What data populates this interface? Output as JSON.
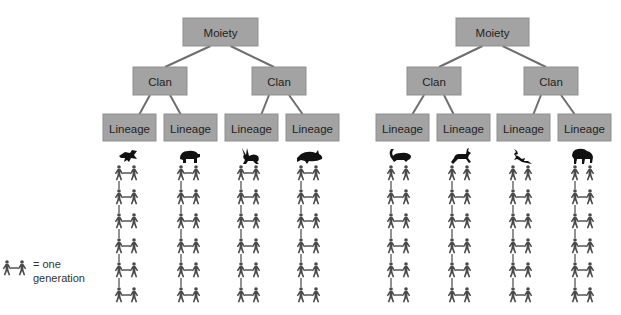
{
  "legend": {
    "line1": "= one",
    "line2": "generation"
  },
  "groups": [
    {
      "moiety": "Moiety",
      "clans": [
        {
          "label": "Clan",
          "lineages": [
            {
              "label": "Lineage",
              "totem": "bird",
              "generations": 6,
              "first_row_married": true
            },
            {
              "label": "Lineage",
              "totem": "bear",
              "generations": 6,
              "first_row_married": true
            }
          ]
        },
        {
          "label": "Clan",
          "lineages": [
            {
              "label": "Lineage",
              "totem": "rabbit",
              "generations": 6,
              "first_row_married": true
            },
            {
              "label": "Lineage",
              "totem": "fish",
              "generations": 6,
              "first_row_married": true
            }
          ]
        }
      ]
    },
    {
      "moiety": "Moiety",
      "clans": [
        {
          "label": "Clan",
          "lineages": [
            {
              "label": "Lineage",
              "totem": "skunk",
              "generations": 6,
              "first_row_married": false
            },
            {
              "label": "Lineage",
              "totem": "antelope",
              "generations": 6,
              "first_row_married": false
            }
          ]
        },
        {
          "label": "Clan",
          "lineages": [
            {
              "label": "Lineage",
              "totem": "lizard",
              "generations": 6,
              "first_row_married": false
            },
            {
              "label": "Lineage",
              "totem": "bison",
              "generations": 6,
              "first_row_married": false
            }
          ]
        }
      ]
    }
  ]
}
